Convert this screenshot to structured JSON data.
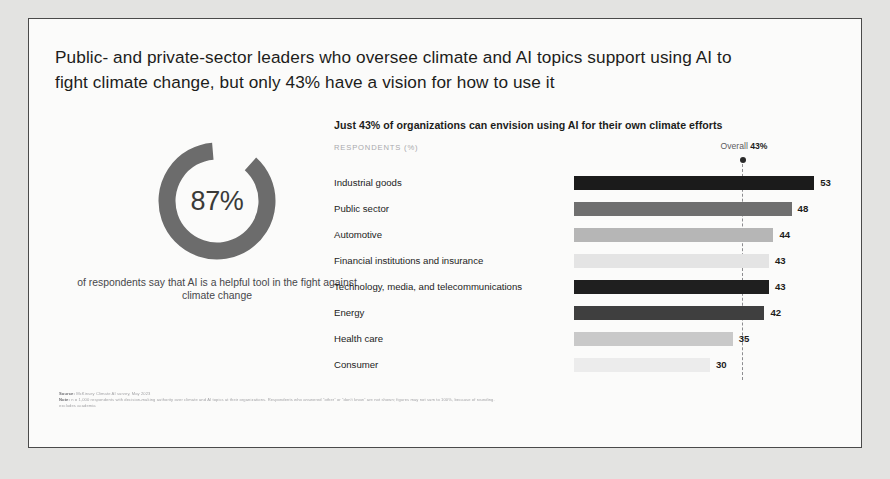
{
  "title": "Public- and private-sector leaders who oversee climate and AI topics support using AI to fight climate change, but only 43% have a vision for how to use it",
  "donut": {
    "value_label": "87%",
    "value": 87,
    "caption": "of respondents say that AI is a helpful tool in the fight against climate change",
    "ring_color": "#6c6c6c",
    "track_color": "#fbfbfa"
  },
  "chart_header": {
    "title": "Just 43% of organizations can envision using AI for their own climate efforts",
    "axis_label": "RESPONDENTS (%)",
    "overall_prefix": "Overall",
    "overall_value": "43%",
    "reference_marker": "overall-dot"
  },
  "chart_data": {
    "type": "bar",
    "orientation": "horizontal",
    "title": "Just 43% of organizations can envision using AI for their own climate efforts",
    "xlabel": "RESPONDENTS (%)",
    "ylabel": "",
    "xlim": [
      0,
      60
    ],
    "grid": false,
    "legend": "none",
    "reference_line": {
      "label": "Overall",
      "value": 43,
      "style": "dashed"
    },
    "categories": [
      "Industrial goods",
      "Public sector",
      "Automotive",
      "Financial institutions and insurance",
      "Technology, media, and telecommunications",
      "Energy",
      "Health care",
      "Consumer"
    ],
    "values": [
      53,
      48,
      44,
      43,
      43,
      42,
      35,
      30
    ],
    "value_labels": [
      "53",
      "48",
      "44",
      "43",
      "43",
      "42",
      "35",
      "30"
    ],
    "bar_colors": [
      "#1b1b1b",
      "#6f6f6f",
      "#b6b6b6",
      "#e4e4e4",
      "#1f1f1f",
      "#3f3f3f",
      "#c9c9c9",
      "#ececec"
    ]
  },
  "footnotes": {
    "source_label": "Source:",
    "source_text": "McKinsey Climate AI survey, May 2023",
    "note_label": "Note:",
    "note_text": "n = 1,000 respondents with decision-making authority over climate and AI topics at their organizations. Respondents who answered “other” or “don’t know” are not shown; figures may not sum to 100%, because of rounding.",
    "note_text_2": "excludes academia"
  }
}
